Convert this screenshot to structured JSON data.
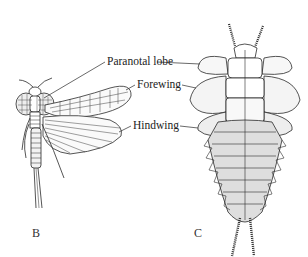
{
  "figure": {
    "labels": {
      "paranotal_lobe": "Paranotal lobe",
      "forewing": "Forewing",
      "hindwing": "Hindwing"
    },
    "panels": {
      "b": "B",
      "c": "C"
    },
    "colors": {
      "ink": "#2a2a2a",
      "shade": "#cfcfcf",
      "background": "#ffffff"
    }
  }
}
